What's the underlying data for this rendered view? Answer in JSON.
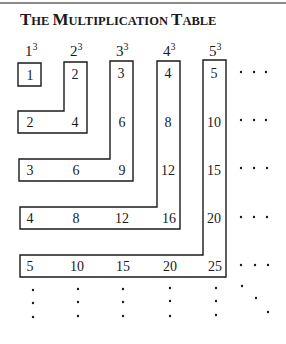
{
  "figure": {
    "title_parts": [
      {
        "text": "T",
        "big": true
      },
      {
        "text": "HE ",
        "big": false
      },
      {
        "text": "M",
        "big": true
      },
      {
        "text": "ULTIPLICATION ",
        "big": false
      },
      {
        "text": "T",
        "big": true
      },
      {
        "text": "ABLE",
        "big": false
      }
    ],
    "title": "The Multiplication Table",
    "column_headers": [
      {
        "base": "1",
        "exp": "3"
      },
      {
        "base": "2",
        "exp": "3"
      },
      {
        "base": "3",
        "exp": "3"
      },
      {
        "base": "4",
        "exp": "3"
      },
      {
        "base": "5",
        "exp": "3"
      }
    ],
    "rows": [
      [
        "1",
        "2",
        "3",
        "4",
        "5"
      ],
      [
        "2",
        "4",
        "6",
        "8",
        "10"
      ],
      [
        "3",
        "6",
        "9",
        "12",
        "15"
      ],
      [
        "4",
        "8",
        "12",
        "16",
        "20"
      ],
      [
        "5",
        "10",
        "15",
        "20",
        "25"
      ]
    ],
    "continuation": "· · ·",
    "colors": {
      "stroke": "#1a1a1a",
      "rule": "#8a8a8a",
      "background": "#ffffff"
    }
  }
}
